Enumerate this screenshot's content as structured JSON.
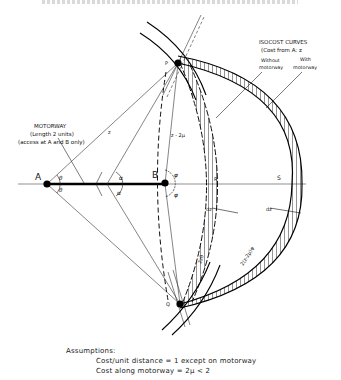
{
  "figure": {
    "header_cropped": true,
    "points": {
      "A": "A",
      "B": "B",
      "P": "P",
      "Q": "Q",
      "R": "R",
      "S": "S"
    },
    "angles": {
      "theta_upper": "θ",
      "theta_lower": "θ",
      "alpha_upper": "α",
      "alpha_lower": "α",
      "phi_upper": "φ",
      "phi_lower": "φ"
    },
    "lengths": {
      "AP": "z",
      "BP": "z - 2μ",
      "dz_inner": "dz",
      "dz_outer": "dz",
      "inner_arc": "2zθ",
      "outer_arc": "2(z-2μ)φ"
    },
    "motorway_note": {
      "line1": "MOTORWAY",
      "line2": "(Length 2 units)",
      "line3": "(access at A and B only)"
    },
    "isocost_note": {
      "title": "ISOCOST  CURVES",
      "subtitle": "(Cost from A: z",
      "without": [
        "Without",
        "motorway"
      ],
      "with": [
        "With",
        "motorway"
      ]
    }
  },
  "assumptions": {
    "heading": "Assumptions:",
    "line1": "Cost/unit distance = 1 except on motorway",
    "line2": "Cost along motorway = 2μ < 2"
  }
}
